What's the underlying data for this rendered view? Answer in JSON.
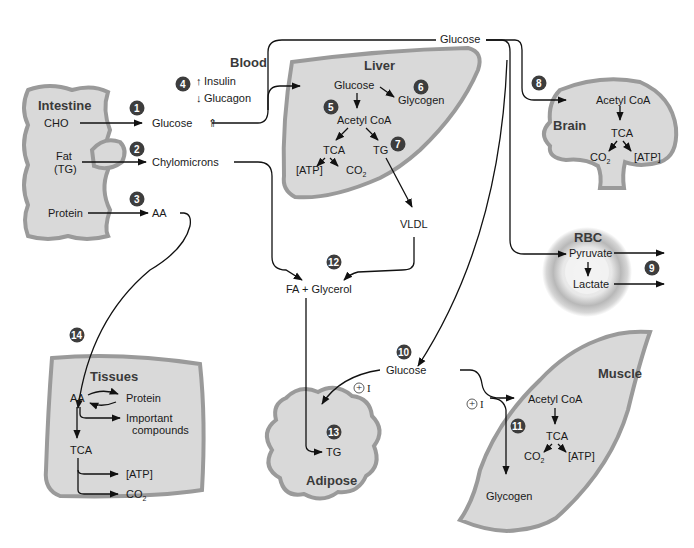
{
  "diagram": {
    "type": "metabolic-pathway-overview",
    "organs": {
      "intestine": {
        "title": "Intestine",
        "inputs": [
          "CHO",
          "Fat\n(TG)",
          "Protein"
        ],
        "fat_line1": "Fat",
        "fat_line2": "(TG)"
      },
      "blood": {
        "title": "Blood",
        "insulin": "Insulin",
        "glucagon": "Glucagon",
        "insulin_dir": "up",
        "glucagon_dir": "down"
      },
      "liver": {
        "title": "Liver",
        "nodes": [
          "Glucose",
          "Glycogen",
          "Acetyl CoA",
          "TCA",
          "TG",
          "[ATP]",
          "CO2"
        ]
      },
      "brain": {
        "title": "Brain",
        "nodes": [
          "Acetyl CoA",
          "TCA",
          "CO2",
          "[ATP]"
        ]
      },
      "rbc": {
        "title": "RBC",
        "nodes": [
          "Pyruvate",
          "Lactate"
        ]
      },
      "tissues": {
        "title": "Tissues",
        "nodes": [
          "AA",
          "Protein",
          "Important",
          "compounds",
          "TCA",
          "[ATP]",
          "CO2"
        ]
      },
      "adipose": {
        "title": "Adipose",
        "nodes": [
          "TG"
        ]
      },
      "muscle": {
        "title": "Muscle",
        "nodes": [
          "Acetyl CoA",
          "TCA",
          "CO2",
          "[ATP]",
          "Glycogen"
        ]
      }
    },
    "labels": {
      "cho": "CHO",
      "protein": "Protein",
      "glucose_blood": "Glucose",
      "chylomicrons": "Chylomicrons",
      "aa": "AA",
      "glucose_top": "Glucose",
      "liver_glucose": "Glucose",
      "liver_glycogen": "Glycogen",
      "liver_acetyl": "Acetyl CoA",
      "liver_tca": "TCA",
      "liver_tg": "TG",
      "liver_atp": "[ATP]",
      "co2": "CO",
      "co2_sub": "2",
      "vldl": "VLDL",
      "fa_glycerol": "FA + Glycerol",
      "brain_acetyl": "Acetyl CoA",
      "brain_tca": "TCA",
      "brain_atp": "[ATP]",
      "rbc_pyruvate": "Pyruvate",
      "rbc_lactate": "Lactate",
      "glucose_lower": "Glucose",
      "insulin_plus": "+",
      "insulin_I": "I",
      "adipose_tg": "TG",
      "muscle_acetyl": "Acetyl CoA",
      "muscle_tca": "TCA",
      "muscle_atp": "[ATP]",
      "muscle_glycogen": "Glycogen",
      "tissue_aa": "AA",
      "tissue_protein": "Protein",
      "tissue_important": "Important",
      "tissue_compounds": "compounds",
      "tissue_tca": "TCA",
      "tissue_atp": "[ATP]"
    },
    "badges": [
      "1",
      "2",
      "3",
      "4",
      "5",
      "6",
      "7",
      "8",
      "9",
      "10",
      "11",
      "12",
      "13",
      "14"
    ],
    "colors": {
      "organ_fill": "#d9d9d9",
      "organ_edge": "#9a9a9a",
      "badge": "#3d3d3d",
      "line": "#111111",
      "title": "#3a3a3a"
    }
  }
}
